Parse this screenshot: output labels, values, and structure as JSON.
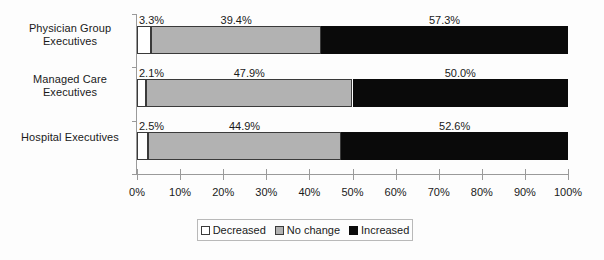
{
  "chart_data": {
    "type": "bar",
    "orientation": "horizontal",
    "stacked": true,
    "normalized_percent": true,
    "title": "",
    "xlabel": "",
    "ylabel": "",
    "xlim": [
      0,
      100
    ],
    "grid": false,
    "legend_position": "bottom",
    "categories": [
      "Physician Group Executives",
      "Managed Care Executives",
      "Hospital Executives"
    ],
    "category_lines": [
      [
        "Physician Group",
        "Executives"
      ],
      [
        "Managed Care",
        "Executives"
      ],
      [
        "Hospital Executives"
      ]
    ],
    "series": [
      {
        "name": "Decreased",
        "color": "#ffffff",
        "values": [
          3.3,
          2.1,
          2.5
        ],
        "labels": [
          "3.3%",
          "2.1%",
          "2.5%"
        ]
      },
      {
        "name": "No change",
        "color": "#b2b2b2",
        "values": [
          39.4,
          47.9,
          44.9
        ],
        "labels": [
          "39.4%",
          "47.9%",
          "44.9%"
        ]
      },
      {
        "name": "Increased",
        "color": "#0a0a0a",
        "values": [
          57.3,
          50.0,
          52.6
        ],
        "labels": [
          "57.3%",
          "50.0%",
          "52.6%"
        ]
      }
    ],
    "xticks": [
      0,
      10,
      20,
      30,
      40,
      50,
      60,
      70,
      80,
      90,
      100
    ],
    "xtick_labels": [
      "0%",
      "10%",
      "20%",
      "30%",
      "40%",
      "50%",
      "60%",
      "70%",
      "80%",
      "90%",
      "100%"
    ]
  },
  "legend": {
    "items": [
      {
        "label": "Decreased",
        "swatch": "decreased-swatch"
      },
      {
        "label": "No change",
        "swatch": "no-change-swatch"
      },
      {
        "label": "Increased",
        "swatch": "increased-swatch"
      }
    ]
  }
}
